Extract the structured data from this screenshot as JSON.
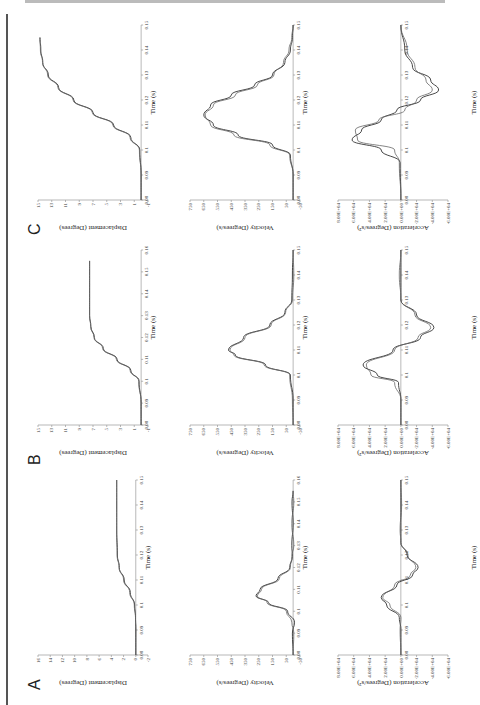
{
  "figure": {
    "orientation": "rotated-90-ccw",
    "panel_labels": [
      "A",
      "B",
      "C"
    ],
    "x_axis_label": "Time (s)",
    "row_labels": {
      "displacement": "Displacement (Degrees)",
      "velocity": "Velocity (Degrees/s)",
      "acceleration": "Acceleration (Degrees/s²)"
    }
  },
  "chart_data": [
    {
      "panel": "A",
      "type": "line",
      "title": "",
      "xlabel": "Time (s)",
      "ylabel": "Displacement (Degrees)",
      "xticks": [
        "0.08",
        "0.09",
        "0.1",
        "0.11",
        "0.12",
        "0.13",
        "0.14",
        "0.15"
      ],
      "yticks": [
        "-2",
        "0",
        "2",
        "4",
        "6",
        "8",
        "10",
        "12",
        "14",
        "16"
      ],
      "xlim": [
        0.08,
        0.15
      ],
      "ylim": [
        -2,
        16
      ],
      "series": [
        {
          "name": "trace 1",
          "x": [
            0.08,
            0.09,
            0.095,
            0.1,
            0.105,
            0.11,
            0.115,
            0.12,
            0.13,
            0.14,
            0.15
          ],
          "values": [
            0,
            0,
            0.05,
            0.2,
            0.9,
            1.9,
            2.7,
            3.0,
            3.1,
            3.1,
            3.1
          ]
        },
        {
          "name": "trace 2",
          "x": [
            0.08,
            0.09,
            0.095,
            0.1,
            0.105,
            0.11,
            0.115,
            0.12,
            0.13,
            0.14,
            0.15
          ],
          "values": [
            0,
            0,
            0.05,
            0.25,
            1.0,
            2.0,
            2.75,
            3.05,
            3.15,
            3.15,
            3.15
          ]
        }
      ]
    },
    {
      "panel": "A",
      "type": "line",
      "xlabel": "Time (s)",
      "ylabel": "Velocity (Degrees/s)",
      "xticks": [
        "0.08",
        "0.09",
        "0.1",
        "0.11",
        "0.12",
        "0.13",
        "0.14",
        "0.15",
        "0.16"
      ],
      "yticks": [
        "-50",
        "50",
        "150",
        "250",
        "350",
        "450",
        "550",
        "650",
        "750"
      ],
      "xlim": [
        0.08,
        0.16
      ],
      "ylim": [
        -50,
        750
      ],
      "series": [
        {
          "name": "trace 1",
          "x": [
            0.08,
            0.09,
            0.095,
            0.1,
            0.104,
            0.107,
            0.11,
            0.115,
            0.12,
            0.125,
            0.13,
            0.14,
            0.15,
            0.155
          ],
          "values": [
            0,
            5,
            -10,
            40,
            180,
            270,
            240,
            110,
            25,
            5,
            10,
            0,
            8,
            0
          ]
        },
        {
          "name": "trace 2",
          "x": [
            0.08,
            0.09,
            0.095,
            0.1,
            0.104,
            0.107,
            0.11,
            0.115,
            0.12,
            0.125,
            0.13,
            0.14,
            0.15,
            0.155
          ],
          "values": [
            0,
            -5,
            10,
            50,
            190,
            260,
            230,
            100,
            20,
            10,
            -5,
            10,
            -5,
            0
          ]
        }
      ]
    },
    {
      "panel": "A",
      "type": "line",
      "xlabel": "Time (s)",
      "ylabel": "Acceleration (Degrees/s²)",
      "xticks": [
        "0.08",
        "0.09",
        "0.1",
        "0.11",
        "0.12",
        "0.13",
        "0.14",
        "0.15"
      ],
      "yticks": [
        "-6.00E+04",
        "-4.00E+04",
        "-2.00E+04",
        "0.00E+00",
        "2.00E+04",
        "4.00E+04",
        "6.00E+04",
        "8.00E+04"
      ],
      "xlim": [
        0.08,
        0.15
      ],
      "ylim": [
        -60000,
        80000
      ],
      "series": [
        {
          "name": "trace 1",
          "x": [
            0.08,
            0.09,
            0.095,
            0.1,
            0.103,
            0.108,
            0.112,
            0.115,
            0.12,
            0.125,
            0.13,
            0.14,
            0.15
          ],
          "values": [
            0,
            0,
            2000,
            18000,
            25000,
            5000,
            -15000,
            -22000,
            -8000,
            0,
            0,
            0,
            0
          ]
        },
        {
          "name": "trace 2",
          "x": [
            0.08,
            0.09,
            0.095,
            0.1,
            0.103,
            0.108,
            0.112,
            0.115,
            0.12,
            0.125,
            0.13,
            0.14,
            0.15
          ],
          "values": [
            0,
            1000,
            0,
            14000,
            23000,
            8000,
            -12000,
            -19000,
            -9000,
            0,
            1000,
            -1000,
            0
          ]
        }
      ]
    },
    {
      "panel": "B",
      "type": "line",
      "xlabel": "Time (s)",
      "ylabel": "Displacement (Degrees)",
      "xticks": [
        "0.08",
        "0.09",
        "0.1",
        "0.11",
        "0.12",
        "0.13",
        "0.14",
        "0.15",
        "0.16"
      ],
      "yticks": [
        "-1",
        "1",
        "3",
        "5",
        "7",
        "9",
        "11",
        "13",
        "15"
      ],
      "xlim": [
        0.08,
        0.16
      ],
      "ylim": [
        -1,
        15
      ],
      "series": [
        {
          "name": "trace 1",
          "x": [
            0.08,
            0.09,
            0.1,
            0.105,
            0.11,
            0.115,
            0.12,
            0.125,
            0.13,
            0.14,
            0.15,
            0.155
          ],
          "values": [
            0,
            0,
            0.3,
            1.5,
            3.5,
            5.5,
            6.8,
            7.3,
            7.5,
            7.5,
            7.5,
            7.5
          ]
        },
        {
          "name": "trace 2",
          "x": [
            0.08,
            0.09,
            0.1,
            0.105,
            0.11,
            0.115,
            0.12,
            0.125,
            0.13,
            0.14,
            0.15,
            0.155
          ],
          "values": [
            0,
            0,
            0.35,
            1.6,
            3.6,
            5.6,
            6.85,
            7.35,
            7.5,
            7.5,
            7.5,
            7.5
          ]
        }
      ]
    },
    {
      "panel": "B",
      "type": "line",
      "xlabel": "Time (s)",
      "ylabel": "Velocity (Degrees/s)",
      "xticks": [
        "0.08",
        "0.09",
        "0.1",
        "0.11",
        "0.12",
        "0.13",
        "0.14",
        "0.15"
      ],
      "yticks": [
        "-50",
        "50",
        "150",
        "250",
        "350",
        "450",
        "550",
        "650",
        "750"
      ],
      "xlim": [
        0.08,
        0.15
      ],
      "ylim": [
        -50,
        750
      ],
      "series": [
        {
          "name": "trace 1",
          "x": [
            0.08,
            0.09,
            0.1,
            0.104,
            0.108,
            0.11,
            0.115,
            0.12,
            0.125,
            0.13,
            0.14,
            0.15
          ],
          "values": [
            0,
            0,
            20,
            200,
            420,
            470,
            360,
            170,
            60,
            10,
            5,
            0
          ]
        },
        {
          "name": "trace 2",
          "x": [
            0.08,
            0.09,
            0.1,
            0.104,
            0.108,
            0.11,
            0.115,
            0.12,
            0.125,
            0.13,
            0.14,
            0.15
          ],
          "values": [
            0,
            5,
            25,
            210,
            430,
            460,
            350,
            160,
            55,
            5,
            -5,
            0
          ]
        }
      ]
    },
    {
      "panel": "B",
      "type": "line",
      "xlabel": "Time (s)",
      "ylabel": "Acceleration (Degrees/s²)",
      "xticks": [
        "0.08",
        "0.09",
        "0.1",
        "0.11",
        "0.12",
        "0.13",
        "0.14",
        "0.15"
      ],
      "yticks": [
        "-6.00E+04",
        "-4.00E+04",
        "-2.00E+04",
        "0.00E+00",
        "2.00E+04",
        "4.00E+04",
        "6.00E+04",
        "8.00E+04"
      ],
      "xlim": [
        0.08,
        0.15
      ],
      "ylim": [
        -60000,
        80000
      ],
      "series": [
        {
          "name": "trace 1",
          "x": [
            0.08,
            0.09,
            0.097,
            0.1,
            0.104,
            0.11,
            0.115,
            0.119,
            0.124,
            0.13,
            0.14,
            0.15
          ],
          "values": [
            0,
            0,
            3000,
            30000,
            48000,
            10000,
            -25000,
            -42000,
            -20000,
            0,
            0,
            0
          ]
        },
        {
          "name": "trace 2",
          "x": [
            0.08,
            0.09,
            0.097,
            0.1,
            0.104,
            0.11,
            0.115,
            0.119,
            0.124,
            0.13,
            0.14,
            0.15
          ],
          "values": [
            0,
            0,
            8000,
            38000,
            44000,
            8000,
            -22000,
            -38000,
            -18000,
            0,
            2000,
            0
          ]
        }
      ]
    },
    {
      "panel": "C",
      "type": "line",
      "xlabel": "Time (s)",
      "ylabel": "Displacement (Degrees)",
      "xticks": [
        "0.08",
        "0.09",
        "0.1",
        "0.11",
        "0.12",
        "0.13",
        "0.14",
        "0.15"
      ],
      "yticks": [
        "-1",
        "1",
        "3",
        "5",
        "7",
        "9",
        "11",
        "13",
        "15"
      ],
      "xlim": [
        0.08,
        0.15
      ],
      "ylim": [
        -1,
        15
      ],
      "series": [
        {
          "name": "trace 1",
          "x": [
            0.08,
            0.09,
            0.1,
            0.105,
            0.11,
            0.115,
            0.12,
            0.125,
            0.13,
            0.135,
            0.14,
            0.145
          ],
          "values": [
            0,
            0,
            0.2,
            1.5,
            4,
            7,
            9.8,
            12,
            13.5,
            14.3,
            14.6,
            14.7
          ]
        },
        {
          "name": "trace 2",
          "x": [
            0.08,
            0.09,
            0.1,
            0.105,
            0.11,
            0.115,
            0.12,
            0.125,
            0.13,
            0.135,
            0.14,
            0.145
          ],
          "values": [
            0,
            0,
            0.25,
            1.6,
            4.1,
            7.1,
            9.9,
            12.1,
            13.6,
            14.35,
            14.65,
            14.75
          ]
        }
      ]
    },
    {
      "panel": "C",
      "type": "line",
      "xlabel": "Time (s)",
      "ylabel": "Velocity (Degrees/s)",
      "xticks": [
        "0.08",
        "0.09",
        "0.1",
        "0.11",
        "0.12",
        "0.13",
        "0.14",
        "0.15"
      ],
      "yticks": [
        "-50",
        "50",
        "150",
        "250",
        "350",
        "450",
        "550",
        "650",
        "750"
      ],
      "xlim": [
        0.08,
        0.15
      ],
      "ylim": [
        -50,
        750
      ],
      "series": [
        {
          "name": "trace 1",
          "x": [
            0.08,
            0.09,
            0.098,
            0.102,
            0.106,
            0.11,
            0.114,
            0.118,
            0.122,
            0.126,
            0.13,
            0.135,
            0.14,
            0.145,
            0.15
          ],
          "values": [
            0,
            0,
            20,
            150,
            400,
            580,
            650,
            600,
            450,
            280,
            150,
            60,
            20,
            5,
            0
          ]
        },
        {
          "name": "trace 2",
          "x": [
            0.08,
            0.09,
            0.098,
            0.102,
            0.106,
            0.11,
            0.114,
            0.118,
            0.122,
            0.126,
            0.13,
            0.135,
            0.14,
            0.145,
            0.15
          ],
          "values": [
            0,
            0,
            25,
            170,
            430,
            600,
            640,
            580,
            420,
            260,
            140,
            70,
            30,
            10,
            0
          ]
        }
      ]
    },
    {
      "panel": "C",
      "type": "line",
      "xlabel": "Time (s)",
      "ylabel": "Acceleration (Degrees/s²)",
      "xticks": [
        "0.08",
        "0.09",
        "0.1",
        "0.11",
        "0.12",
        "0.13",
        "0.14",
        "0.15"
      ],
      "yticks": [
        "-6.00E+04",
        "-4.00E+04",
        "-2.00E+04",
        "0.00E+00",
        "2.00E+04",
        "4.00E+04",
        "6.00E+04",
        "8.00E+04"
      ],
      "xlim": [
        0.08,
        0.15
      ],
      "ylim": [
        -60000,
        80000
      ],
      "series": [
        {
          "name": "trace 1",
          "x": [
            0.08,
            0.095,
            0.1,
            0.104,
            0.108,
            0.112,
            0.116,
            0.12,
            0.124,
            0.128,
            0.133,
            0.14,
            0.15
          ],
          "values": [
            0,
            1000,
            25000,
            62000,
            50000,
            25000,
            5000,
            -25000,
            -48000,
            -38000,
            -15000,
            -5000,
            0
          ]
        },
        {
          "name": "trace 2",
          "x": [
            0.08,
            0.095,
            0.1,
            0.104,
            0.108,
            0.112,
            0.116,
            0.12,
            0.124,
            0.128,
            0.133,
            0.14,
            0.15
          ],
          "values": [
            0,
            2000,
            8000,
            55000,
            58000,
            28000,
            -5000,
            -20000,
            -40000,
            -32000,
            -18000,
            -8000,
            0
          ]
        }
      ]
    }
  ]
}
